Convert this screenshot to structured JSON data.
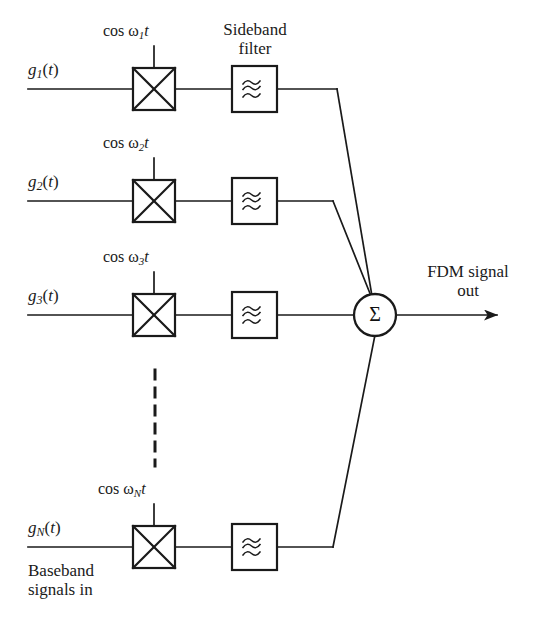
{
  "figure": {
    "stroke_color": "#1a1a1a",
    "background_color": "#ffffff"
  },
  "labels": {
    "sideband_filter_line1": "Sideband",
    "sideband_filter_line2": "filter",
    "fdm_out_line1": "FDM signal",
    "fdm_out_line2": "out",
    "baseband_line1": "Baseband",
    "baseband_line2": "signals in",
    "summer_symbol": "Σ",
    "cos_prefix": "cos ",
    "omega": "ω",
    "t_var": "t",
    "paren_open": "(",
    "paren_close": ")",
    "g_symbol": "g"
  },
  "channels": [
    {
      "id": "channel-1",
      "input_label": "g₁(t)",
      "input_base": "g",
      "input_sub": "1",
      "carrier_label": "cos ω₁t",
      "carrier_sub": "1",
      "multiplier_name": "multiplier",
      "filter_name": "sideband-filter"
    },
    {
      "id": "channel-2",
      "input_label": "g₂(t)",
      "input_base": "g",
      "input_sub": "2",
      "carrier_label": "cos ω₂t",
      "carrier_sub": "2",
      "multiplier_name": "multiplier",
      "filter_name": "sideband-filter"
    },
    {
      "id": "channel-3",
      "input_label": "g₃(t)",
      "input_base": "g",
      "input_sub": "3",
      "carrier_label": "cos ω₃t",
      "carrier_sub": "3",
      "multiplier_name": "multiplier",
      "filter_name": "sideband-filter"
    },
    {
      "id": "channel-n",
      "input_label": "gₙ(t)",
      "input_base": "g",
      "input_sub": "N",
      "carrier_label": "cos ωₙt",
      "carrier_sub": "N",
      "multiplier_name": "multiplier",
      "filter_name": "sideband-filter"
    }
  ],
  "icons": {
    "multiplier": "multiplier-x-icon",
    "filter": "filter-wave-icon",
    "summer": "summation-sigma-icon",
    "output_arrow": "arrow-right-icon",
    "continuation": "vertical-dashed-ellipsis-icon"
  }
}
